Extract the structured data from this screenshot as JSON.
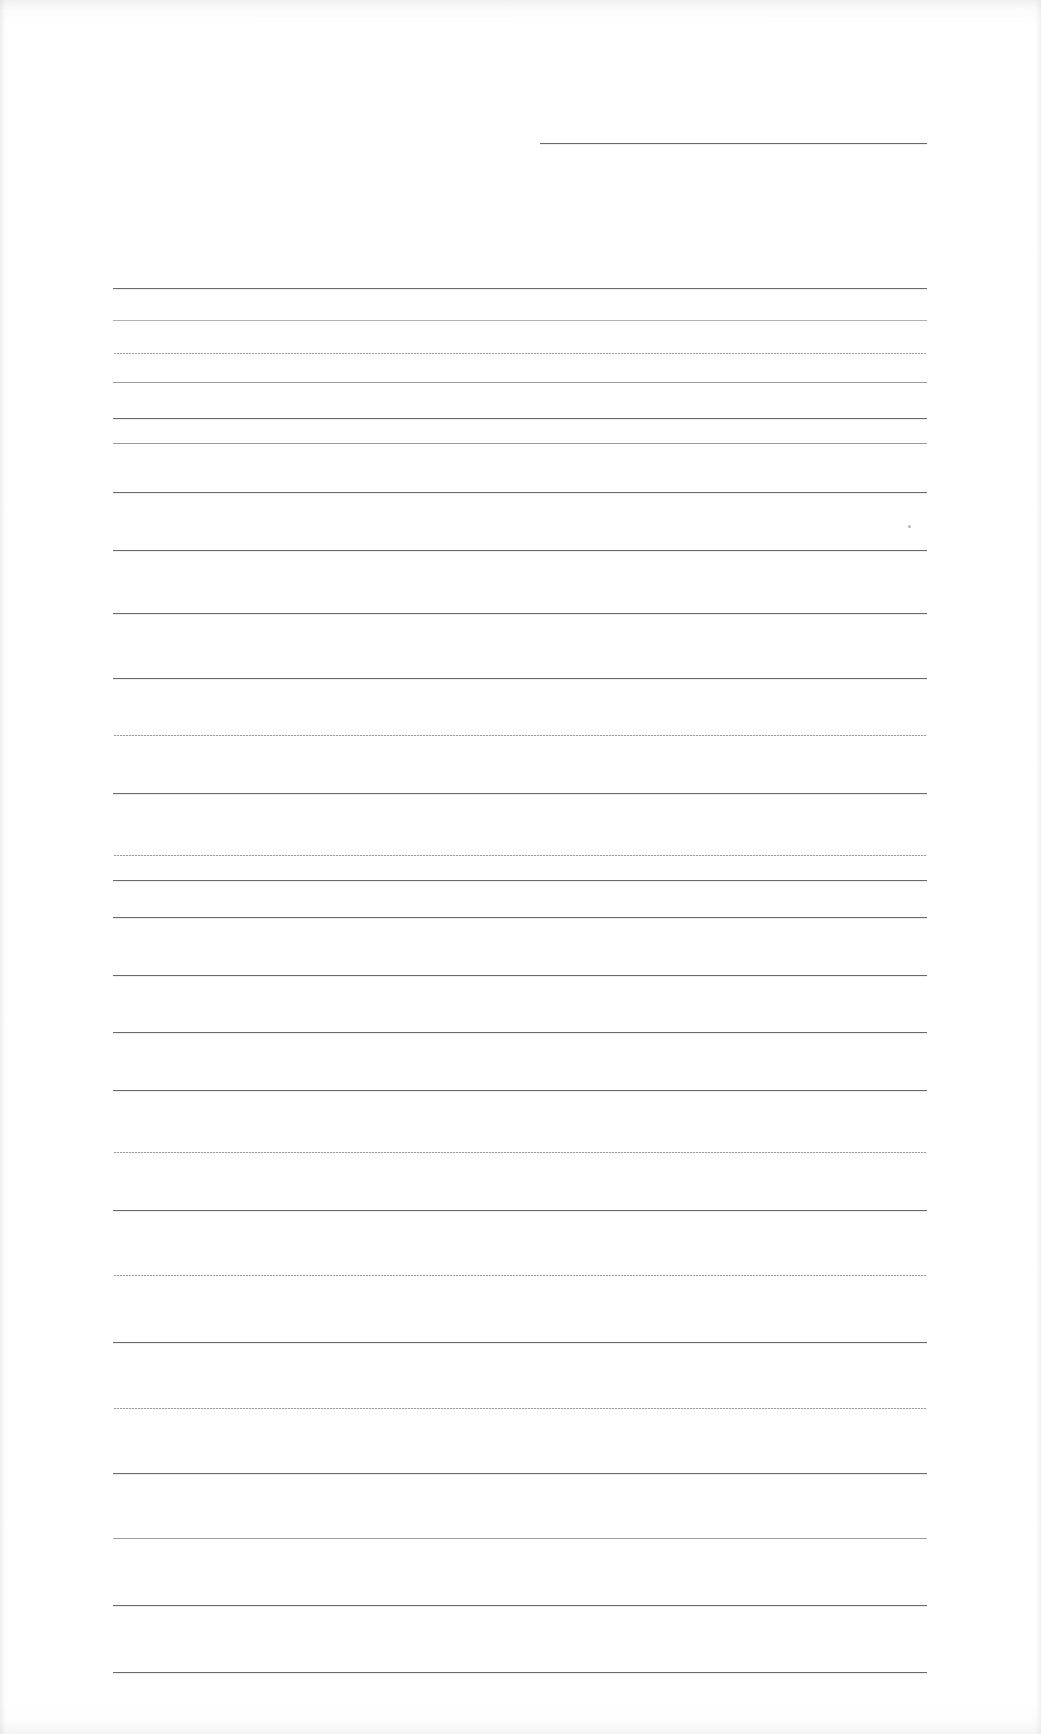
{
  "document": {
    "kind": "scanned-lined-page",
    "title": "Blank ruled page",
    "page_width": 1041,
    "page_height": 1734,
    "background_color": "#ffffff",
    "line_color_dark": "#6a6a6d",
    "line_color_light": "#9c9ca0",
    "line_color_faint": "#b2b2b6",
    "content_text": "",
    "visible_text_count": 0
  },
  "layout": {
    "ruled_area": {
      "left": 113,
      "right": 927,
      "first_line_y": 288,
      "last_line_y": 1672,
      "line_spacing": 65,
      "line_count": 22
    },
    "header_rule": {
      "left": 540,
      "right": 927,
      "y": 143
    }
  },
  "rules": [
    {
      "name": "header-rule",
      "y": 143,
      "x": 540,
      "w": 387,
      "weight": "solid"
    },
    {
      "name": "rule-01",
      "y": 288,
      "x": 113,
      "w": 814,
      "weight": "solid"
    },
    {
      "name": "rule-02",
      "y": 320,
      "x": 113,
      "w": 814,
      "weight": "faint"
    },
    {
      "name": "rule-03",
      "y": 353,
      "x": 113,
      "w": 814,
      "weight": "dotted"
    },
    {
      "name": "rule-04",
      "y": 382,
      "x": 113,
      "w": 814,
      "weight": "light"
    },
    {
      "name": "rule-05",
      "y": 418,
      "x": 113,
      "w": 814,
      "weight": "solid"
    },
    {
      "name": "rule-06",
      "y": 443,
      "x": 113,
      "w": 814,
      "weight": "light"
    },
    {
      "name": "rule-07",
      "y": 492,
      "x": 113,
      "w": 814,
      "weight": "solid"
    },
    {
      "name": "rule-08",
      "y": 550,
      "x": 113,
      "w": 814,
      "weight": "solid"
    },
    {
      "name": "rule-09",
      "y": 613,
      "x": 113,
      "w": 814,
      "weight": "solid"
    },
    {
      "name": "rule-10",
      "y": 678,
      "x": 113,
      "w": 814,
      "weight": "solid"
    },
    {
      "name": "rule-11",
      "y": 735,
      "x": 113,
      "w": 814,
      "weight": "dotted"
    },
    {
      "name": "rule-12",
      "y": 793,
      "x": 113,
      "w": 814,
      "weight": "solid"
    },
    {
      "name": "rule-13",
      "y": 855,
      "x": 113,
      "w": 814,
      "weight": "dotted"
    },
    {
      "name": "rule-14",
      "y": 880,
      "x": 113,
      "w": 814,
      "weight": "solid"
    },
    {
      "name": "rule-15",
      "y": 917,
      "x": 113,
      "w": 814,
      "weight": "solid"
    },
    {
      "name": "rule-16",
      "y": 975,
      "x": 113,
      "w": 814,
      "weight": "solid"
    },
    {
      "name": "rule-17",
      "y": 1032,
      "x": 113,
      "w": 814,
      "weight": "solid"
    },
    {
      "name": "rule-18",
      "y": 1090,
      "x": 113,
      "w": 814,
      "weight": "solid"
    },
    {
      "name": "rule-19",
      "y": 1152,
      "x": 113,
      "w": 814,
      "weight": "dotted"
    },
    {
      "name": "rule-20",
      "y": 1210,
      "x": 113,
      "w": 814,
      "weight": "solid"
    },
    {
      "name": "rule-21",
      "y": 1275,
      "x": 113,
      "w": 814,
      "weight": "dotted"
    },
    {
      "name": "rule-22",
      "y": 1342,
      "x": 113,
      "w": 814,
      "weight": "solid"
    },
    {
      "name": "rule-23",
      "y": 1408,
      "x": 113,
      "w": 814,
      "weight": "dotted"
    },
    {
      "name": "rule-24",
      "y": 1473,
      "x": 113,
      "w": 814,
      "weight": "solid"
    },
    {
      "name": "rule-25",
      "y": 1538,
      "x": 113,
      "w": 814,
      "weight": "light"
    },
    {
      "name": "rule-26",
      "y": 1605,
      "x": 113,
      "w": 814,
      "weight": "solid"
    },
    {
      "name": "rule-27",
      "y": 1672,
      "x": 113,
      "w": 814,
      "weight": "solid"
    }
  ],
  "specks": [
    {
      "name": "speck-right-margin",
      "x": 908,
      "y": 525,
      "size": 3
    }
  ]
}
